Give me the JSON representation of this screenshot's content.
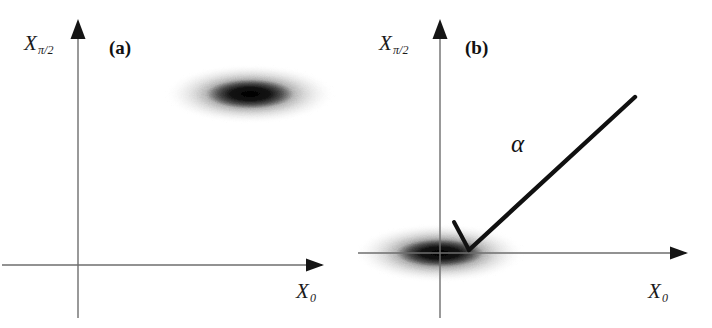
{
  "figure": {
    "width": 712,
    "height": 328,
    "background_color": "#ffffff",
    "ink_color": "#1b1b1b",
    "axis_color": "#6b6b6b"
  },
  "panels": [
    {
      "tag": "(a)",
      "name": "panel-a",
      "axes": {
        "x_label_base": "X",
        "x_label_sub": "0",
        "y_label_base": "X",
        "y_label_sub": "π/2",
        "origin_x": 78,
        "origin_y": 265,
        "x_axis_end": 330,
        "y_axis_top": 22,
        "y_axis_bottom": 318,
        "x_axis_start": 2,
        "arrowhead": "solid-triangle"
      },
      "blob": {
        "center_x": 250,
        "center_y": 94,
        "radius_x": 86,
        "radius_y": 30,
        "core_radius_x": 42,
        "core_radius_y": 14,
        "angle_deg": 0,
        "peak_darkness": 0.92,
        "description": "displaced squeezed state, horizontally elongated Gaussian"
      },
      "vector": null
    },
    {
      "tag": "(b)",
      "name": "panel-b",
      "axes": {
        "x_label_base": "X",
        "x_label_sub": "0",
        "y_label_base": "X",
        "y_label_sub": "π/2",
        "origin_x": 84,
        "origin_y": 253,
        "x_axis_end": 338,
        "y_axis_top": 22,
        "y_axis_bottom": 318,
        "x_axis_start": 2,
        "arrowhead": "solid-triangle"
      },
      "blob": {
        "center_x": 84,
        "center_y": 253,
        "radius_x": 86,
        "radius_y": 30,
        "core_radius_x": 42,
        "core_radius_y": 13,
        "angle_deg": 0,
        "peak_darkness": 0.92,
        "description": "squeezed vacuum centred on origin, horizontally elongated Gaussian"
      },
      "vector": {
        "label": "α",
        "tail_x": 279,
        "tail_y": 97,
        "head_x": 112,
        "head_y": 250,
        "line_width": 4.2,
        "arrowhead": "barb",
        "description": "displacement amplitude vector alpha pointing into the distribution centre"
      }
    }
  ]
}
